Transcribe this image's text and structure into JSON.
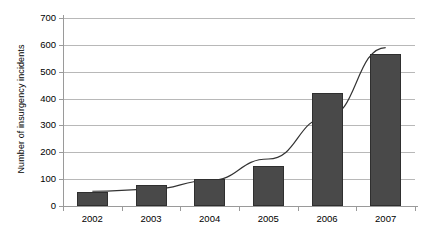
{
  "chart_data": {
    "type": "bar",
    "title": "",
    "xlabel": "",
    "ylabel": "Number of insurgency incidents",
    "categories": [
      "2002",
      "2003",
      "2004",
      "2005",
      "2006",
      "2007"
    ],
    "values": [
      52,
      80,
      100,
      150,
      420,
      565
    ],
    "series": [
      {
        "name": "Number of insurgency incidents",
        "values": [
          52,
          80,
          100,
          150,
          420,
          565
        ],
        "color": "#494949"
      },
      {
        "name": "trendline",
        "type": "line",
        "values": [
          55,
          62,
          95,
          175,
          330,
          590
        ],
        "color": "#333333"
      }
    ],
    "ylim": [
      0,
      700
    ],
    "ytick_values": [
      0,
      100,
      200,
      300,
      400,
      500,
      600,
      700
    ],
    "ytick_labels": [
      "0",
      "100",
      "200",
      "300",
      "400",
      "500",
      "600",
      "700"
    ],
    "grid": true,
    "grid_axis": "y",
    "legend": false,
    "legend_position": "none",
    "bar_color": "#494949",
    "gridline_color": "#b8b8b8",
    "axis_color": "#9a9a9a"
  }
}
